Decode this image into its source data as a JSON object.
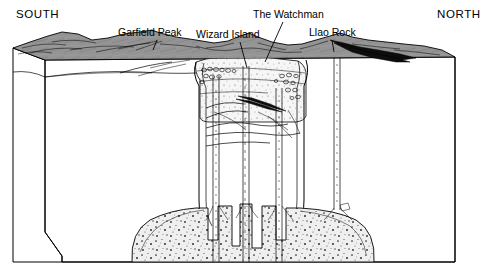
{
  "figure": {
    "orientation_labels": {
      "left": "SOUTH",
      "right": "NORTH"
    },
    "features": [
      {
        "id": "garfield-peak",
        "label": "Garfield Peak",
        "label_x": 118,
        "label_y": 36,
        "leader_x1": 157,
        "leader_y1": 40,
        "leader_x2": 153,
        "leader_y2": 50
      },
      {
        "id": "wizard-island",
        "label": "Wizard Island",
        "label_x": 196,
        "label_y": 38,
        "leader_x1": 240,
        "leader_y1": 42,
        "leader_x2": 247,
        "leader_y2": 68
      },
      {
        "id": "the-watchman",
        "label": "The Watchman",
        "label_x": 253,
        "label_y": 18,
        "leader_x1": 283,
        "leader_y1": 22,
        "leader_x2": 265,
        "leader_y2": 62
      },
      {
        "id": "llao-rock",
        "label": "Llao Rock",
        "label_x": 309,
        "label_y": 36,
        "leader_x1": 332,
        "leader_y1": 40,
        "leader_x2": 334,
        "leader_y2": 52
      }
    ],
    "colors": {
      "ink": "#000000",
      "paper": "#ffffff",
      "terrain_surface": "#8a8a8a",
      "terrain_surface_light": "#9e9e9e",
      "caldera_fill": "#f2f2f2",
      "magma_chamber": "#ededed",
      "lava_flow_dark": "#0d0d0d"
    },
    "legend_note": "",
    "units": {
      "width_px": 492,
      "height_px": 280
    }
  }
}
